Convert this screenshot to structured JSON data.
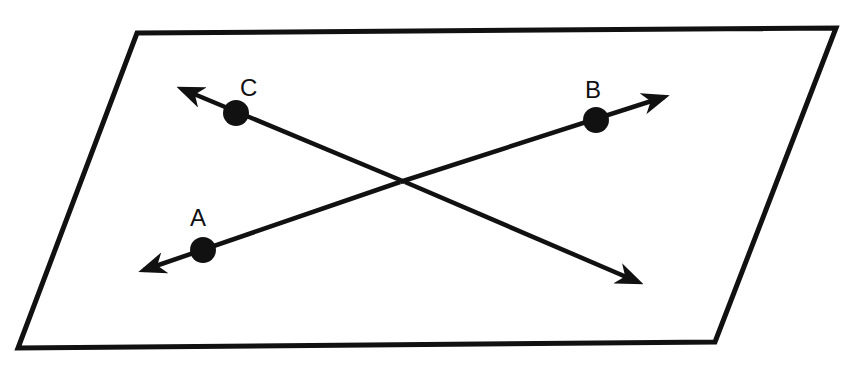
{
  "diagram": {
    "colors": {
      "stroke": "#111111",
      "background": "#ffffff"
    },
    "plane": {
      "shape": "parallelogram"
    },
    "lines": [
      {
        "name": "line-AB",
        "through": [
          "A",
          "B"
        ],
        "arrows": "both"
      },
      {
        "name": "line-C",
        "through": [
          "C"
        ],
        "arrows": "both"
      }
    ],
    "points": [
      {
        "label": "A"
      },
      {
        "label": "B"
      },
      {
        "label": "C"
      }
    ]
  }
}
